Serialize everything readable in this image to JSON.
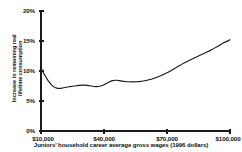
{
  "chart_data": {
    "type": "line",
    "title": "",
    "subtitle": "",
    "xlabel": "Juniors' household career average gross wages (1996 dollars)",
    "ylabel": "Increase in remaining real lifetime consumption",
    "ylabel_line1": "Increase in remaining real",
    "ylabel_line2": "lifetime consumption",
    "xlim": [
      10000,
      100000
    ],
    "ylim": [
      0,
      20
    ],
    "grid": false,
    "legend": "none",
    "line_color": "#1a1a1a",
    "xticks": [
      10000,
      40000,
      70000,
      100000
    ],
    "xtick_labels": [
      "$10,000",
      "$40,000",
      "$70,000",
      "$100,000"
    ],
    "yticks": [
      0,
      5,
      10,
      15,
      20
    ],
    "ytick_labels": [
      "0%",
      "5%",
      "10%",
      "15%",
      "20%"
    ],
    "series": [
      {
        "name": "Increase in remaining real lifetime consumption",
        "x": [
          10000,
          11000,
          12000,
          13000,
          14000,
          15000,
          16000,
          17000,
          18000,
          19000,
          20000,
          22000,
          24000,
          26000,
          28000,
          30000,
          32000,
          34000,
          36000,
          38000,
          40000,
          42000,
          44000,
          46000,
          48000,
          50000,
          52000,
          55000,
          58000,
          61000,
          64000,
          67000,
          70000,
          73000,
          76000,
          79000,
          82000,
          85000,
          88000,
          91000,
          94000,
          97000,
          100000
        ],
        "values": [
          10.5,
          9.8,
          9.2,
          8.6,
          8.1,
          7.7,
          7.4,
          7.2,
          7.1,
          7.1,
          7.15,
          7.3,
          7.4,
          7.5,
          7.6,
          7.65,
          7.6,
          7.5,
          7.4,
          7.45,
          7.7,
          8.1,
          8.4,
          8.45,
          8.35,
          8.25,
          8.2,
          8.2,
          8.3,
          8.5,
          8.8,
          9.2,
          9.7,
          10.3,
          10.9,
          11.5,
          12.0,
          12.5,
          13.0,
          13.5,
          14.1,
          14.7,
          15.2
        ]
      }
    ]
  },
  "axes": {
    "y_ticks": [
      {
        "label": "20%",
        "value": 20
      },
      {
        "label": "15%",
        "value": 15
      },
      {
        "label": "10%",
        "value": 10
      },
      {
        "label": "5%",
        "value": 5
      },
      {
        "label": "0%",
        "value": 0
      }
    ],
    "x_ticks": [
      {
        "label": "$10,000",
        "value": 10000
      },
      {
        "label": "$40,000",
        "value": 40000
      },
      {
        "label": "$70,000",
        "value": 70000
      },
      {
        "label": "$100,000",
        "value": 100000
      }
    ]
  }
}
